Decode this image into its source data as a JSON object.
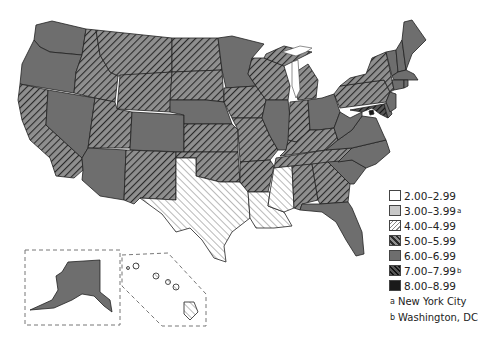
{
  "map": {
    "title": "",
    "legend": {
      "items": [
        {
          "range": "2.00–2.99",
          "footnote": "",
          "fill": "white",
          "color": "#ffffff"
        },
        {
          "range": "3.00–3.99",
          "footnote": "a",
          "fill": "light-gray",
          "color": "#c8c8c8"
        },
        {
          "range": "4.00–4.99",
          "footnote": "",
          "fill": "light-hatch",
          "color": "#ffffff"
        },
        {
          "range": "5.00–5.99",
          "footnote": "",
          "fill": "medium-hatch",
          "color": "#8c8c8c"
        },
        {
          "range": "6.00–6.99",
          "footnote": "",
          "fill": "gray",
          "color": "#6e6e6e"
        },
        {
          "range": "7.00–7.99",
          "footnote": "b",
          "fill": "dark-hatch",
          "color": "#333333"
        },
        {
          "range": "8.00–8.99",
          "footnote": "",
          "fill": "black",
          "color": "#1a1a1a"
        }
      ],
      "footnotes": [
        {
          "mark": "a",
          "text": "New York City"
        },
        {
          "mark": "b",
          "text": "Washington, DC"
        }
      ]
    },
    "states": {
      "WA": "6.00-6.99",
      "OR": "6.00-6.99",
      "CA": "5.00-5.99",
      "NV": "6.00-6.99",
      "ID": "5.00-5.99",
      "MT": "5.00-5.99",
      "WY": "5.00-5.99",
      "UT": "5.00-5.99",
      "AZ": "6.00-6.99",
      "CO": "6.00-6.99",
      "NM": "5.00-5.99",
      "ND": "5.00-5.99",
      "SD": "5.00-5.99",
      "NE": "6.00-6.99",
      "KS": "5.00-5.99",
      "OK": "5.00-5.99",
      "TX": "4.00-4.99",
      "MN": "6.00-6.99",
      "IA": "5.00-5.99",
      "MO": "5.00-5.99",
      "AR": "5.00-5.99",
      "LA": "4.00-4.99",
      "WI": "5.00-5.99",
      "IL": "6.00-6.99",
      "MI": "5.00-5.99",
      "IN": "5.00-5.99",
      "OH": "6.00-6.99",
      "KY": "5.00-5.99",
      "TN": "5.00-5.99",
      "MS": "4.00-4.99",
      "AL": "5.00-5.99",
      "GA": "5.00-5.99",
      "FL": "6.00-6.99",
      "SC": "6.00-6.99",
      "NC": "6.00-6.99",
      "VA": "6.00-6.99",
      "WV": "6.00-6.99",
      "PA": "5.00-5.99",
      "NY": "5.00-5.99",
      "VT": "6.00-6.99",
      "NH": "6.00-6.99",
      "ME": "6.00-6.99",
      "MA": "6.00-6.99",
      "CT": "6.00-6.99",
      "RI": "6.00-6.99",
      "NJ": "6.00-6.99",
      "DE": "6.00-6.99",
      "MD": "7.00-7.99",
      "DC": "8.00-8.99",
      "AK": "6.00-6.99",
      "HI": "4.00-4.99"
    }
  }
}
